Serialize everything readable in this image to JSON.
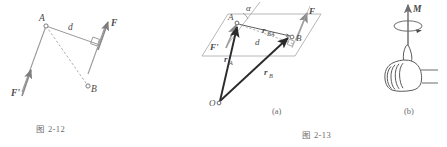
{
  "page": {
    "width": 447,
    "height": 147,
    "background": "#ffffff",
    "ink_color": "#4a4a4a",
    "light_ink_color": "#8d8d8d",
    "caption_color": "#6b6b6b"
  },
  "figure_left": {
    "caption": "图 2-12",
    "labels": {
      "point_a": "A",
      "point_b": "B",
      "distance_d": "d",
      "force_f": "F",
      "force_f_prime": "F'"
    },
    "annotations": {
      "right_angle_marker": "right-angle-square"
    }
  },
  "figure_right": {
    "caption": "图 2-13",
    "panel_a": {
      "sublabel": "(a)",
      "labels": {
        "point_a": "A",
        "point_b": "B",
        "point_o": "O",
        "angle_alpha": "α",
        "distance_d": "d",
        "vector_r_ba": "r",
        "vector_r_ba_sub": "BA",
        "vector_r_a": "r",
        "vector_r_a_sub": "A",
        "vector_r_b": "r",
        "vector_r_b_sub": "B",
        "force_f": "F",
        "force_f_prime": "F'"
      },
      "annotations": {
        "plane": "parallelogram-plane",
        "right_angle_marker": "right-angle-square"
      }
    },
    "panel_b": {
      "sublabel": "(b)",
      "labels": {
        "moment_m": "M"
      },
      "annotations": {
        "hand": "right-hand-thumbs-up-icon",
        "rotation": "circular-rotation-arrow",
        "axis": "vertical-axis-arrow"
      }
    }
  }
}
